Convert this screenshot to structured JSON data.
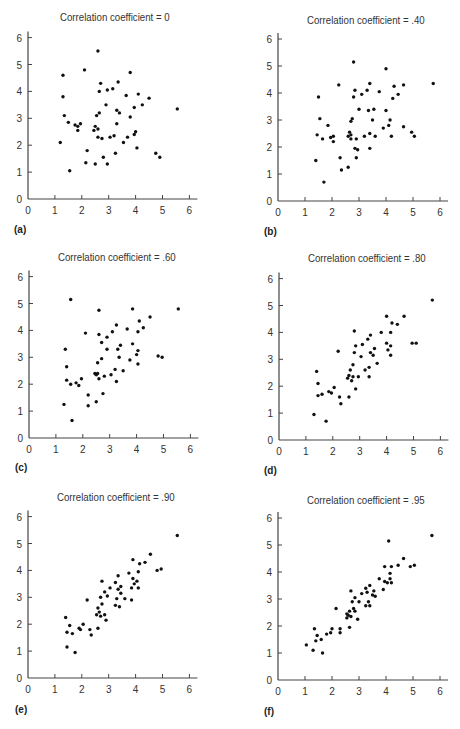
{
  "chart_data": [
    {
      "id": "a",
      "type": "scatter",
      "panel_label": "(a)",
      "title": "Correlation coefficient = 0",
      "xlabel": "",
      "ylabel": "",
      "xlim": [
        0,
        6
      ],
      "ylim": [
        0,
        6
      ],
      "xticks": [
        "0",
        "1",
        "2",
        "3",
        "4",
        "5",
        "6"
      ],
      "yticks": [
        "0",
        "1",
        "2",
        "3",
        "4",
        "5",
        "6"
      ],
      "grid": false,
      "points": [
        [
          1.2,
          2.1
        ],
        [
          1.3,
          4.6
        ],
        [
          1.3,
          3.8
        ],
        [
          1.35,
          3.1
        ],
        [
          1.5,
          2.85
        ],
        [
          1.55,
          1.05
        ],
        [
          1.75,
          2.75
        ],
        [
          1.85,
          2.7
        ],
        [
          1.85,
          2.55
        ],
        [
          1.95,
          2.8
        ],
        [
          2.1,
          4.8
        ],
        [
          2.15,
          1.35
        ],
        [
          2.2,
          1.8
        ],
        [
          2.45,
          2.55
        ],
        [
          2.5,
          2.7
        ],
        [
          2.5,
          1.3
        ],
        [
          2.55,
          3.1
        ],
        [
          2.6,
          2.6
        ],
        [
          2.6,
          2.3
        ],
        [
          2.6,
          5.5
        ],
        [
          2.65,
          4.0
        ],
        [
          2.65,
          3.2
        ],
        [
          2.7,
          4.3
        ],
        [
          2.75,
          2.25
        ],
        [
          2.8,
          1.55
        ],
        [
          2.9,
          3.5
        ],
        [
          2.95,
          4.05
        ],
        [
          2.95,
          1.3
        ],
        [
          3.05,
          2.3
        ],
        [
          3.15,
          4.1
        ],
        [
          3.2,
          2.35
        ],
        [
          3.25,
          1.7
        ],
        [
          3.3,
          3.3
        ],
        [
          3.3,
          2.8
        ],
        [
          3.35,
          4.35
        ],
        [
          3.4,
          3.2
        ],
        [
          3.55,
          2.1
        ],
        [
          3.65,
          3.85
        ],
        [
          3.7,
          2.3
        ],
        [
          3.8,
          4.7
        ],
        [
          3.8,
          3.05
        ],
        [
          3.95,
          3.4
        ],
        [
          3.95,
          2.4
        ],
        [
          4.0,
          2.5
        ],
        [
          4.05,
          1.9
        ],
        [
          4.1,
          3.9
        ],
        [
          4.25,
          3.5
        ],
        [
          4.5,
          3.75
        ],
        [
          4.75,
          1.7
        ],
        [
          4.9,
          1.55
        ],
        [
          5.55,
          3.35
        ]
      ]
    },
    {
      "id": "b",
      "type": "scatter",
      "panel_label": "(b)",
      "title": "Correlation coefficient = .40",
      "xlabel": "",
      "ylabel": "",
      "xlim": [
        0,
        6
      ],
      "ylim": [
        0,
        6
      ],
      "xticks": [
        "0",
        "1",
        "2",
        "3",
        "4",
        "5",
        "6"
      ],
      "yticks": [
        "0",
        "1",
        "2",
        "3",
        "4",
        "5",
        "6"
      ],
      "grid": false,
      "points": [
        [
          1.4,
          1.5
        ],
        [
          1.45,
          2.45
        ],
        [
          1.5,
          3.85
        ],
        [
          1.55,
          3.05
        ],
        [
          1.65,
          2.3
        ],
        [
          1.7,
          0.7
        ],
        [
          1.85,
          2.8
        ],
        [
          1.95,
          2.35
        ],
        [
          2.05,
          2.2
        ],
        [
          2.05,
          2.4
        ],
        [
          2.25,
          4.3
        ],
        [
          2.3,
          1.6
        ],
        [
          2.35,
          1.15
        ],
        [
          2.6,
          1.25
        ],
        [
          2.6,
          2.4
        ],
        [
          2.65,
          2.55
        ],
        [
          2.7,
          2.45
        ],
        [
          2.7,
          2.3
        ],
        [
          2.7,
          2.95
        ],
        [
          2.75,
          3.05
        ],
        [
          2.8,
          3.85
        ],
        [
          2.8,
          5.15
        ],
        [
          2.85,
          1.95
        ],
        [
          2.85,
          4.1
        ],
        [
          2.9,
          2.3
        ],
        [
          2.9,
          1.6
        ],
        [
          2.95,
          1.9
        ],
        [
          3.0,
          3.4
        ],
        [
          3.1,
          3.95
        ],
        [
          3.2,
          2.4
        ],
        [
          3.3,
          4.1
        ],
        [
          3.35,
          3.35
        ],
        [
          3.4,
          2.5
        ],
        [
          3.4,
          1.95
        ],
        [
          3.4,
          4.35
        ],
        [
          3.5,
          3.0
        ],
        [
          3.55,
          3.4
        ],
        [
          3.6,
          2.4
        ],
        [
          3.75,
          4.05
        ],
        [
          3.9,
          2.7
        ],
        [
          4.0,
          4.9
        ],
        [
          4.0,
          3.35
        ],
        [
          4.1,
          2.8
        ],
        [
          4.15,
          3.0
        ],
        [
          4.2,
          2.4
        ],
        [
          4.25,
          3.8
        ],
        [
          4.3,
          4.25
        ],
        [
          4.45,
          3.95
        ],
        [
          4.65,
          4.3
        ],
        [
          4.65,
          2.75
        ],
        [
          4.95,
          2.55
        ],
        [
          5.05,
          2.4
        ],
        [
          5.75,
          4.35
        ]
      ]
    },
    {
      "id": "c",
      "type": "scatter",
      "panel_label": "(c)",
      "title": "Correlation coefficient = .60",
      "xlabel": "",
      "ylabel": "",
      "xlim": [
        0,
        6
      ],
      "ylim": [
        0,
        6
      ],
      "xticks": [
        "0",
        "1",
        "2",
        "3",
        "4",
        "5",
        "6"
      ],
      "yticks": [
        "0",
        "1",
        "2",
        "3",
        "4",
        "5",
        "6"
      ],
      "grid": false,
      "points": [
        [
          1.3,
          1.25
        ],
        [
          1.35,
          3.3
        ],
        [
          1.4,
          2.65
        ],
        [
          1.4,
          2.15
        ],
        [
          1.55,
          2.0
        ],
        [
          1.55,
          5.15
        ],
        [
          1.6,
          0.65
        ],
        [
          1.75,
          2.05
        ],
        [
          1.85,
          1.95
        ],
        [
          1.95,
          2.2
        ],
        [
          2.1,
          3.9
        ],
        [
          2.2,
          1.6
        ],
        [
          2.2,
          1.2
        ],
        [
          2.45,
          2.4
        ],
        [
          2.5,
          2.35
        ],
        [
          2.5,
          1.35
        ],
        [
          2.55,
          2.4
        ],
        [
          2.55,
          2.8
        ],
        [
          2.6,
          2.2
        ],
        [
          2.6,
          4.75
        ],
        [
          2.6,
          3.85
        ],
        [
          2.7,
          2.95
        ],
        [
          2.7,
          3.55
        ],
        [
          2.75,
          1.65
        ],
        [
          2.8,
          2.3
        ],
        [
          2.9,
          3.3
        ],
        [
          2.9,
          3.75
        ],
        [
          3.05,
          2.35
        ],
        [
          3.1,
          3.95
        ],
        [
          3.2,
          2.55
        ],
        [
          3.25,
          2.1
        ],
        [
          3.25,
          4.2
        ],
        [
          3.3,
          3.3
        ],
        [
          3.35,
          3.0
        ],
        [
          3.4,
          3.45
        ],
        [
          3.5,
          2.5
        ],
        [
          3.65,
          4.05
        ],
        [
          3.75,
          2.9
        ],
        [
          3.85,
          3.5
        ],
        [
          3.85,
          4.8
        ],
        [
          4.0,
          3.1
        ],
        [
          4.05,
          2.75
        ],
        [
          4.05,
          3.95
        ],
        [
          4.05,
          3.25
        ],
        [
          4.1,
          4.35
        ],
        [
          4.25,
          4.1
        ],
        [
          4.5,
          4.5
        ],
        [
          4.8,
          3.05
        ],
        [
          4.95,
          3.0
        ],
        [
          5.55,
          4.8
        ]
      ]
    },
    {
      "id": "d",
      "type": "scatter",
      "panel_label": "(d)",
      "title": "Correlation coefficient = .80",
      "xlabel": "",
      "ylabel": "",
      "xlim": [
        0,
        6
      ],
      "ylim": [
        0,
        6
      ],
      "xticks": [
        "0",
        "1",
        "2",
        "3",
        "4",
        "5",
        "6"
      ],
      "yticks": [
        "0",
        "1",
        "2",
        "3",
        "4",
        "5",
        "6"
      ],
      "grid": false,
      "points": [
        [
          1.3,
          0.95
        ],
        [
          1.4,
          2.55
        ],
        [
          1.45,
          2.1
        ],
        [
          1.45,
          1.65
        ],
        [
          1.6,
          1.7
        ],
        [
          1.75,
          0.7
        ],
        [
          1.85,
          1.8
        ],
        [
          1.95,
          1.75
        ],
        [
          2.05,
          1.95
        ],
        [
          2.2,
          3.3
        ],
        [
          2.25,
          1.6
        ],
        [
          2.3,
          1.35
        ],
        [
          2.55,
          2.3
        ],
        [
          2.6,
          2.4
        ],
        [
          2.6,
          1.6
        ],
        [
          2.65,
          2.6
        ],
        [
          2.7,
          2.2
        ],
        [
          2.75,
          2.8
        ],
        [
          2.75,
          2.35
        ],
        [
          2.8,
          3.25
        ],
        [
          2.8,
          4.05
        ],
        [
          2.85,
          3.5
        ],
        [
          2.85,
          1.9
        ],
        [
          2.95,
          2.35
        ],
        [
          3.05,
          3.1
        ],
        [
          3.1,
          3.55
        ],
        [
          3.2,
          2.6
        ],
        [
          3.3,
          3.75
        ],
        [
          3.35,
          2.7
        ],
        [
          3.35,
          2.35
        ],
        [
          3.4,
          3.25
        ],
        [
          3.4,
          3.9
        ],
        [
          3.5,
          3.15
        ],
        [
          3.55,
          3.4
        ],
        [
          3.65,
          2.85
        ],
        [
          3.8,
          4.0
        ],
        [
          4.0,
          4.6
        ],
        [
          4.0,
          3.6
        ],
        [
          4.05,
          3.35
        ],
        [
          4.15,
          3.15
        ],
        [
          4.15,
          3.5
        ],
        [
          4.15,
          4.0
        ],
        [
          4.2,
          4.35
        ],
        [
          4.4,
          4.3
        ],
        [
          4.65,
          4.6
        ],
        [
          4.95,
          3.6
        ],
        [
          5.1,
          3.6
        ],
        [
          5.7,
          5.2
        ]
      ]
    },
    {
      "id": "e",
      "type": "scatter",
      "panel_label": "(e)",
      "title": "Correlation coefficient = .90",
      "xlabel": "",
      "ylabel": "",
      "xlim": [
        0,
        6
      ],
      "ylim": [
        0,
        6
      ],
      "xticks": [
        "0",
        "1",
        "2",
        "3",
        "4",
        "5",
        "6"
      ],
      "yticks": [
        "0",
        "1",
        "2",
        "3",
        "4",
        "5",
        "6"
      ],
      "grid": false,
      "points": [
        [
          1.4,
          2.25
        ],
        [
          1.45,
          1.7
        ],
        [
          1.45,
          1.15
        ],
        [
          1.55,
          1.95
        ],
        [
          1.65,
          1.65
        ],
        [
          1.75,
          0.95
        ],
        [
          1.9,
          1.85
        ],
        [
          1.95,
          1.8
        ],
        [
          2.05,
          2.0
        ],
        [
          2.2,
          2.9
        ],
        [
          2.3,
          1.8
        ],
        [
          2.35,
          1.6
        ],
        [
          2.55,
          2.35
        ],
        [
          2.6,
          2.6
        ],
        [
          2.6,
          1.85
        ],
        [
          2.65,
          2.45
        ],
        [
          2.7,
          2.3
        ],
        [
          2.7,
          3.0
        ],
        [
          2.75,
          2.75
        ],
        [
          2.75,
          3.6
        ],
        [
          2.85,
          3.2
        ],
        [
          2.85,
          2.35
        ],
        [
          2.9,
          2.15
        ],
        [
          2.95,
          3.05
        ],
        [
          3.05,
          3.35
        ],
        [
          3.25,
          3.55
        ],
        [
          3.25,
          2.7
        ],
        [
          3.3,
          2.95
        ],
        [
          3.35,
          3.8
        ],
        [
          3.35,
          3.3
        ],
        [
          3.4,
          2.65
        ],
        [
          3.45,
          3.15
        ],
        [
          3.45,
          3.4
        ],
        [
          3.6,
          2.95
        ],
        [
          3.75,
          3.9
        ],
        [
          3.85,
          3.35
        ],
        [
          3.85,
          2.9
        ],
        [
          3.9,
          3.7
        ],
        [
          3.9,
          4.4
        ],
        [
          3.95,
          3.5
        ],
        [
          4.05,
          3.6
        ],
        [
          4.1,
          3.35
        ],
        [
          4.1,
          3.95
        ],
        [
          4.15,
          4.25
        ],
        [
          4.35,
          4.3
        ],
        [
          4.55,
          4.6
        ],
        [
          4.8,
          4.0
        ],
        [
          4.95,
          4.05
        ],
        [
          5.55,
          5.3
        ]
      ]
    },
    {
      "id": "f",
      "type": "scatter",
      "panel_label": "(f)",
      "title": "Correlation coefficient = .95",
      "xlabel": "",
      "ylabel": "",
      "xlim": [
        0,
        6
      ],
      "ylim": [
        0,
        6
      ],
      "xticks": [
        "0",
        "1",
        "2",
        "3",
        "4",
        "5",
        "6"
      ],
      "yticks": [
        "0",
        "1",
        "2",
        "3",
        "4",
        "5",
        "6"
      ],
      "grid": false,
      "points": [
        [
          1.05,
          1.3
        ],
        [
          1.3,
          1.1
        ],
        [
          1.35,
          1.9
        ],
        [
          1.4,
          1.45
        ],
        [
          1.45,
          1.65
        ],
        [
          1.6,
          1.5
        ],
        [
          1.65,
          1.0
        ],
        [
          1.8,
          1.7
        ],
        [
          1.95,
          1.75
        ],
        [
          2.0,
          1.9
        ],
        [
          2.15,
          2.65
        ],
        [
          2.3,
          1.75
        ],
        [
          2.3,
          1.9
        ],
        [
          2.55,
          2.3
        ],
        [
          2.55,
          2.45
        ],
        [
          2.6,
          2.4
        ],
        [
          2.65,
          2.55
        ],
        [
          2.65,
          1.95
        ],
        [
          2.7,
          2.35
        ],
        [
          2.7,
          3.3
        ],
        [
          2.75,
          2.9
        ],
        [
          2.8,
          2.65
        ],
        [
          2.85,
          3.05
        ],
        [
          2.85,
          2.55
        ],
        [
          2.95,
          2.25
        ],
        [
          3.0,
          2.9
        ],
        [
          3.1,
          3.2
        ],
        [
          3.25,
          2.75
        ],
        [
          3.25,
          3.4
        ],
        [
          3.3,
          3.25
        ],
        [
          3.35,
          2.9
        ],
        [
          3.4,
          2.75
        ],
        [
          3.4,
          3.5
        ],
        [
          3.5,
          3.15
        ],
        [
          3.55,
          3.3
        ],
        [
          3.6,
          3.1
        ],
        [
          3.75,
          3.75
        ],
        [
          3.9,
          3.35
        ],
        [
          3.95,
          3.65
        ],
        [
          3.95,
          4.2
        ],
        [
          4.05,
          3.6
        ],
        [
          4.1,
          5.15
        ],
        [
          4.15,
          3.75
        ],
        [
          4.15,
          3.95
        ],
        [
          4.2,
          3.6
        ],
        [
          4.2,
          4.2
        ],
        [
          4.45,
          4.25
        ],
        [
          4.65,
          4.5
        ],
        [
          4.9,
          4.2
        ],
        [
          5.05,
          4.25
        ],
        [
          5.7,
          5.35
        ]
      ]
    }
  ],
  "panels": {
    "a": {
      "title": "Correlation coefficient = 0",
      "label": "(a)"
    },
    "b": {
      "title": "Correlation coefficient = .40",
      "label": "(b)"
    },
    "c": {
      "title": "Correlation coefficient = .60",
      "label": "(c)"
    },
    "d": {
      "title": "Correlation coefficient = .80",
      "label": "(d)"
    },
    "e": {
      "title": "Correlation coefficient = .90",
      "label": "(e)"
    },
    "f": {
      "title": "Correlation coefficient = .95",
      "label": "(f)"
    }
  },
  "style": {
    "axis_color": "#444444",
    "point_color": "#111111",
    "background": "#ffffff"
  }
}
